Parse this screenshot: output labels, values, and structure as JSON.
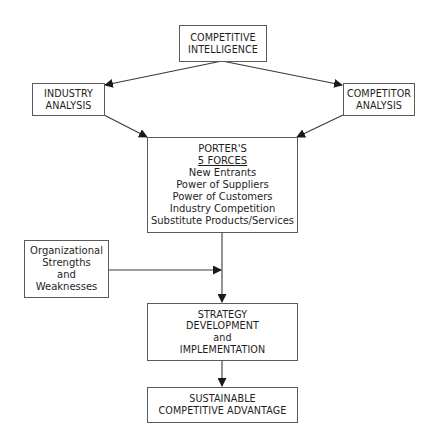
{
  "diagram": {
    "type": "flowchart",
    "nodes": {
      "competitive_intelligence": {
        "lines": [
          "COMPETITIVE",
          "INTELLIGENCE"
        ]
      },
      "industry_analysis": {
        "lines": [
          "INDUSTRY",
          "ANALYSIS"
        ]
      },
      "competitor_analysis": {
        "lines": [
          "COMPETITOR",
          "ANALYSIS"
        ]
      },
      "porters_five_forces": {
        "title": "PORTER'S",
        "subtitle": "5 FORCES",
        "items": [
          "New Entrants",
          "Power of Suppliers",
          "Power of Customers",
          "Industry Competition",
          "Substitute Products/Services"
        ]
      },
      "org_strengths_weaknesses": {
        "lines": [
          "Organizational",
          "Strengths",
          "and",
          "Weaknesses"
        ]
      },
      "strategy": {
        "lines": [
          "STRATEGY",
          "DEVELOPMENT",
          "and",
          "IMPLEMENTATION"
        ]
      },
      "sustainable_advantage": {
        "lines": [
          "SUSTAINABLE",
          "COMPETITIVE ADVANTAGE"
        ]
      }
    },
    "edges": [
      {
        "from": "competitive_intelligence",
        "to": "industry_analysis"
      },
      {
        "from": "competitive_intelligence",
        "to": "competitor_analysis"
      },
      {
        "from": "industry_analysis",
        "to": "porters_five_forces"
      },
      {
        "from": "competitor_analysis",
        "to": "porters_five_forces"
      },
      {
        "from": "porters_five_forces",
        "to": "strategy"
      },
      {
        "from": "org_strengths_weaknesses",
        "to": "strategy"
      },
      {
        "from": "strategy",
        "to": "sustainable_advantage"
      }
    ],
    "colors": {
      "line": "#3a3a3a",
      "border": "#5a5a5a",
      "text": "#1e1e1e"
    }
  }
}
